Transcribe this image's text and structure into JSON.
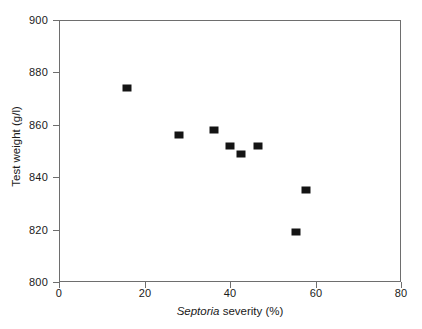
{
  "chart_data": {
    "type": "scatter",
    "title": "",
    "xlabel_prefix": "Septoria",
    "xlabel_suffix": " severity (%)",
    "xlabel": "Septoria severity (%)",
    "ylabel": "Test weight (g/l)",
    "xlim": [
      0,
      80
    ],
    "ylim": [
      800,
      900
    ],
    "xticks": [
      "0",
      "20",
      "40",
      "60",
      "80"
    ],
    "xtick_values": [
      0,
      20,
      40,
      60,
      80
    ],
    "yticks": [
      "900",
      "880",
      "860",
      "840",
      "820",
      "800"
    ],
    "ytick_values": [
      900,
      880,
      860,
      840,
      820,
      800
    ],
    "grid": false,
    "legend": "none",
    "marker": "filled-square",
    "marker_color": "#141414",
    "frame_color": "#6e6e6e",
    "series": [
      {
        "name": "Test weight vs Septoria severity",
        "points": [
          {
            "x": 15.9,
            "y": 874
          },
          {
            "x": 28.1,
            "y": 856
          },
          {
            "x": 36.3,
            "y": 858
          },
          {
            "x": 40.0,
            "y": 852
          },
          {
            "x": 42.6,
            "y": 849
          },
          {
            "x": 46.5,
            "y": 852
          },
          {
            "x": 55.4,
            "y": 819
          },
          {
            "x": 57.8,
            "y": 835
          }
        ]
      }
    ]
  }
}
